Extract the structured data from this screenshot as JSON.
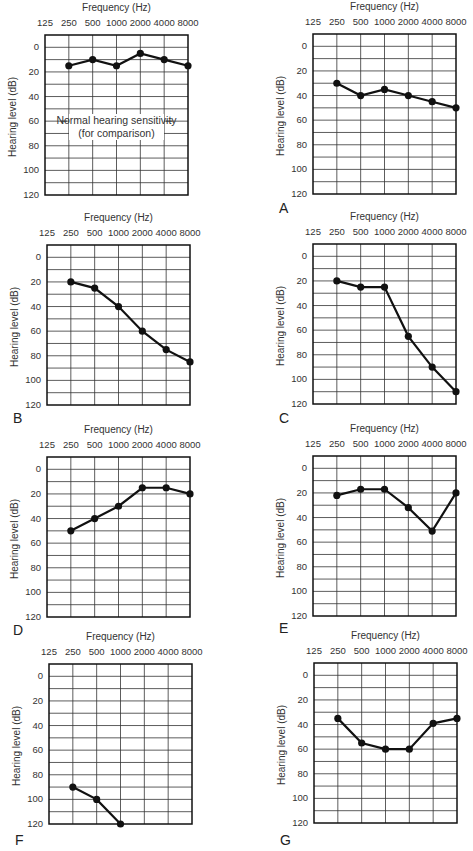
{
  "figure": {
    "frequency_title": "Frequency (Hz)",
    "y_axis_label": "Hearing level (dB)",
    "x_ticks": [
      "125",
      "250",
      "500",
      "1000",
      "2000",
      "4000",
      "8000"
    ],
    "y_ticks": [
      "0",
      "20",
      "40",
      "60",
      "80",
      "100",
      "120"
    ],
    "normal_note_line1": "Normal hearing sensitivity",
    "normal_note_line2": "(for comparison)"
  },
  "chart_data": [
    {
      "type": "line",
      "panel": "",
      "title": "Normal hearing sensitivity (for comparison)",
      "xlabel": "Frequency (Hz)",
      "ylabel": "Hearing level (dB)",
      "categories": [
        "250",
        "500",
        "1000",
        "2000",
        "4000",
        "8000"
      ],
      "values": [
        15,
        10,
        15,
        5,
        10,
        15
      ],
      "ylim": [
        120,
        -10
      ],
      "grid": true
    },
    {
      "type": "line",
      "panel": "A",
      "xlabel": "Frequency (Hz)",
      "ylabel": "Hearing level (dB)",
      "categories": [
        "250",
        "500",
        "1000",
        "2000",
        "4000",
        "8000"
      ],
      "values": [
        30,
        40,
        35,
        40,
        45,
        50
      ],
      "ylim": [
        120,
        -10
      ],
      "grid": true
    },
    {
      "type": "line",
      "panel": "B",
      "xlabel": "Frequency (Hz)",
      "ylabel": "Hearing level (dB)",
      "categories": [
        "250",
        "500",
        "1000",
        "2000",
        "4000",
        "8000"
      ],
      "values": [
        20,
        25,
        40,
        60,
        75,
        85
      ],
      "ylim": [
        120,
        -10
      ],
      "grid": true
    },
    {
      "type": "line",
      "panel": "C",
      "xlabel": "Frequency (Hz)",
      "ylabel": "Hearing level (dB)",
      "categories": [
        "250",
        "500",
        "1000",
        "2000",
        "4000",
        "8000"
      ],
      "values": [
        20,
        25,
        25,
        65,
        90,
        110
      ],
      "ylim": [
        120,
        -10
      ],
      "grid": true
    },
    {
      "type": "line",
      "panel": "D",
      "xlabel": "Frequency (Hz)",
      "ylabel": "Hearing level (dB)",
      "categories": [
        "250",
        "500",
        "1000",
        "2000",
        "4000",
        "8000"
      ],
      "values": [
        50,
        40,
        30,
        15,
        15,
        20
      ],
      "ylim": [
        120,
        -10
      ],
      "grid": true
    },
    {
      "type": "line",
      "panel": "E",
      "xlabel": "Frequency (Hz)",
      "ylabel": "Hearing level (dB)",
      "categories": [
        "250",
        "500",
        "1000",
        "2000",
        "4000",
        "8000"
      ],
      "values": [
        22,
        17,
        17,
        32,
        51,
        20
      ],
      "ylim": [
        120,
        -10
      ],
      "grid": true
    },
    {
      "type": "line",
      "panel": "F",
      "xlabel": "Frequency (Hz)",
      "ylabel": "Hearing level (dB)",
      "categories": [
        "250",
        "500",
        "1000",
        "2000",
        "4000",
        "8000"
      ],
      "values": [
        90,
        100,
        120,
        null,
        null,
        null
      ],
      "ylim": [
        120,
        -10
      ],
      "grid": true
    },
    {
      "type": "line",
      "panel": "G",
      "xlabel": "Frequency (Hz)",
      "ylabel": "Hearing level (dB)",
      "categories": [
        "250",
        "500",
        "1000",
        "2000",
        "4000",
        "8000"
      ],
      "values": [
        35,
        55,
        60,
        60,
        39,
        35
      ],
      "ylim": [
        120,
        -10
      ],
      "grid": true
    }
  ],
  "layout": {
    "panels": [
      {
        "left": 0,
        "top": 0,
        "box_x": 45,
        "box_y": 35,
        "letter_y": null
      },
      {
        "left": 236,
        "top": 0,
        "box_x": 77,
        "box_y": 34,
        "letter_y": 200
      },
      {
        "left": 0,
        "top": 210,
        "box_x": 47,
        "box_y": 35,
        "letter_y": 200
      },
      {
        "left": 236,
        "top": 210,
        "box_x": 77,
        "box_y": 34,
        "letter_y": 200
      },
      {
        "left": 0,
        "top": 422,
        "box_x": 47,
        "box_y": 35,
        "letter_y": 200
      },
      {
        "left": 236,
        "top": 422,
        "box_x": 77,
        "box_y": 34,
        "letter_y": 198
      },
      {
        "left": 0,
        "top": 630,
        "box_x": 49,
        "box_y": 34,
        "letter_y": 202
      },
      {
        "left": 236,
        "top": 630,
        "box_x": 78,
        "box_y": 33,
        "letter_y": 202
      }
    ],
    "box_w": 143,
    "box_h": 160,
    "line_color": "#111111",
    "grid_color": "#333333"
  }
}
